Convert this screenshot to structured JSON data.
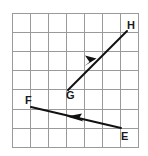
{
  "figure": {
    "background_color": "#ffffff",
    "grid": {
      "columns": 7,
      "rows": 7,
      "cell_size_px": 18,
      "origin_x_px": 12,
      "origin_y_px": 13,
      "line_color": "#9a9a9a",
      "border_color": "#8a8a8a",
      "line_width_px": 1
    },
    "vectors": [
      {
        "name": "GH",
        "from_label": "G",
        "to_label": "H",
        "tail_x": 68,
        "tail_y": 90,
        "head_x": 127,
        "head_y": 31,
        "arrow_position": "midpoint",
        "arrow_direction": "up-right",
        "color": "#111111",
        "stroke_width_px": 2
      },
      {
        "name": "EF",
        "from_label": "E",
        "to_label": "F",
        "tail_x": 121,
        "tail_y": 128,
        "head_x": 31,
        "head_y": 107,
        "arrow_position": "midpoint",
        "arrow_direction": "left",
        "color": "#111111",
        "stroke_width_px": 2
      }
    ],
    "labels": [
      {
        "id": "label-h",
        "text": "H",
        "x": 127,
        "y": 29,
        "anchor": "start"
      },
      {
        "id": "label-g",
        "text": "G",
        "x": 66,
        "y": 99,
        "anchor": "start"
      },
      {
        "id": "label-f",
        "text": "F",
        "x": 25,
        "y": 104,
        "anchor": "start"
      },
      {
        "id": "label-e",
        "text": "E",
        "x": 121,
        "y": 140,
        "anchor": "start"
      }
    ]
  }
}
